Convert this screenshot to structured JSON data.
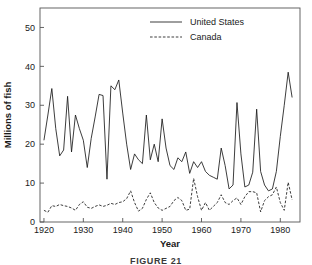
{
  "figure": {
    "caption": "FIGURE 21"
  },
  "chart_data": {
    "type": "line",
    "title": "",
    "xlabel": "Year",
    "ylabel": "Millions of fish",
    "xlim": [
      1919,
      1985
    ],
    "ylim": [
      0,
      55
    ],
    "xticks": [
      1920,
      1930,
      1940,
      1950,
      1960,
      1970,
      1980
    ],
    "yticks": [
      0,
      10,
      20,
      30,
      40,
      50
    ],
    "xtick_labels": [
      "1920",
      "1930",
      "1940",
      "1950",
      "1960",
      "1970",
      "1980"
    ],
    "ytick_labels": [
      "0",
      "10",
      "20",
      "30",
      "40",
      "50"
    ],
    "grid": false,
    "legend_position": "top-center",
    "x": [
      1920,
      1921,
      1922,
      1923,
      1924,
      1925,
      1926,
      1927,
      1928,
      1929,
      1930,
      1931,
      1932,
      1933,
      1934,
      1935,
      1936,
      1937,
      1938,
      1939,
      1940,
      1941,
      1942,
      1943,
      1944,
      1945,
      1946,
      1947,
      1948,
      1949,
      1950,
      1951,
      1952,
      1953,
      1954,
      1955,
      1956,
      1957,
      1958,
      1959,
      1960,
      1961,
      1962,
      1963,
      1964,
      1965,
      1966,
      1967,
      1968,
      1969,
      1970,
      1971,
      1972,
      1973,
      1974,
      1975,
      1976,
      1977,
      1978,
      1979,
      1980,
      1981,
      1982,
      1983
    ],
    "series": [
      {
        "name": "United States",
        "style": "solid",
        "color": "#1a1a1a",
        "values": [
          21.0,
          27.5,
          34.3,
          24.0,
          17.0,
          18.5,
          32.3,
          18.0,
          27.5,
          24.0,
          21.0,
          14.0,
          21.5,
          27.0,
          32.8,
          32.5,
          11.0,
          35.0,
          34.0,
          36.5,
          28.0,
          20.0,
          13.5,
          17.5,
          16.0,
          15.0,
          27.5,
          16.0,
          20.0,
          15.5,
          26.5,
          19.0,
          14.5,
          13.5,
          16.5,
          15.5,
          18.0,
          12.5,
          15.5,
          14.0,
          15.5,
          13.0,
          12.0,
          11.5,
          11.0,
          19.0,
          14.5,
          8.5,
          9.5,
          30.7,
          17.5,
          9.0,
          9.5,
          12.8,
          29.0,
          13.0,
          9.5,
          8.0,
          8.5,
          13.0,
          22.0,
          30.0,
          38.5,
          32.0
        ]
      },
      {
        "name": "Canada",
        "style": "dashed",
        "color": "#1a1a1a",
        "values": [
          3.0,
          2.5,
          4.2,
          4.0,
          4.5,
          4.2,
          4.0,
          3.6,
          3.0,
          4.5,
          5.2,
          3.8,
          3.5,
          4.0,
          4.4,
          4.0,
          4.3,
          4.8,
          4.5,
          5.0,
          5.2,
          6.0,
          8.0,
          5.0,
          2.8,
          3.5,
          5.8,
          7.5,
          5.0,
          3.6,
          3.0,
          3.5,
          4.0,
          5.5,
          6.3,
          5.5,
          3.0,
          3.3,
          11.2,
          6.5,
          3.0,
          5.0,
          3.0,
          4.0,
          5.0,
          7.0,
          5.0,
          4.5,
          5.5,
          6.2,
          4.5,
          6.5,
          7.8,
          7.8,
          7.5,
          2.6,
          5.5,
          6.5,
          7.0,
          9.0,
          5.0,
          3.0,
          10.2,
          5.7
        ]
      }
    ]
  }
}
